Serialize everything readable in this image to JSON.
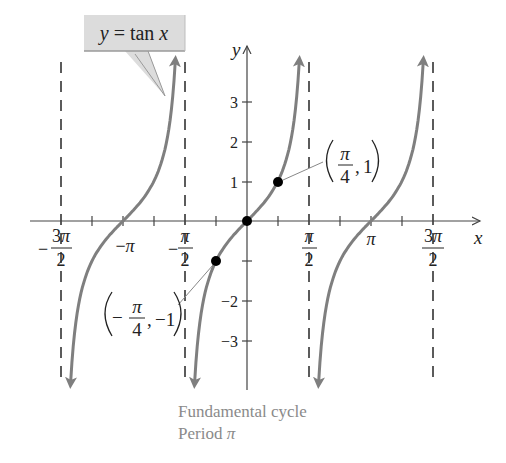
{
  "chart_data": {
    "type": "line",
    "title": "y = tan x",
    "xlabel": "x",
    "ylabel": "y",
    "function": "tan x",
    "x_ticks": [
      "-3π/2",
      "-π",
      "-π/2",
      "π/2",
      "π",
      "3π/2"
    ],
    "x_tick_values": [
      -4.712,
      -3.1416,
      -1.5708,
      1.5708,
      3.1416,
      4.712
    ],
    "minor_x_tick_values": [
      -3.927,
      -2.356,
      -0.785,
      0.785,
      2.356,
      3.927
    ],
    "y_ticks": [
      -3,
      -2,
      -1,
      1,
      2,
      3
    ],
    "xlim": [
      -5.3,
      5.8
    ],
    "ylim": [
      -4.1,
      4.4
    ],
    "asymptotes": [
      "-3π/2",
      "-π/2",
      "π/2",
      "3π/2"
    ],
    "asymptote_values": [
      -4.712,
      -1.5708,
      1.5708,
      4.712
    ],
    "series": [
      {
        "name": "branch (-3π/2, -π/2)",
        "x_range": [
          -4.712,
          -1.5708
        ],
        "center": -3.1416
      },
      {
        "name": "branch (-π/2, π/2) fundamental cycle",
        "x_range": [
          -1.5708,
          1.5708
        ],
        "center": 0
      },
      {
        "name": "branch (π/2, 3π/2)",
        "x_range": [
          1.5708,
          4.712
        ],
        "center": 3.1416
      }
    ],
    "highlighted_points": [
      {
        "x": -0.785,
        "y": -1,
        "label": "(-π/4, -1)"
      },
      {
        "x": 0,
        "y": 0,
        "label": ""
      },
      {
        "x": 0.785,
        "y": 1,
        "label": "(π/4, 1)"
      }
    ],
    "annotations": [
      "y = tan x",
      "(π/4, 1)",
      "(-π/4, -1)",
      "Fundamental cycle",
      "Period π"
    ],
    "grid": false,
    "colors": {
      "curve": "#7f7f7f",
      "axes": "#444444",
      "asymptote": "#333333",
      "callout_fill": "#dcdcdc",
      "callout_border": "#9a9a9a",
      "caption": "#8a8a8a"
    }
  },
  "labels": {
    "callout_y": "y",
    "callout_eq": " = tan ",
    "callout_x": "x",
    "axis_x": "x",
    "axis_y": "y",
    "pi": "π",
    "minus": "−",
    "three": "3",
    "two": "2",
    "four": "4",
    "one": "1",
    "neg_one": "−1",
    "comma": ",",
    "y1": "1",
    "y2": "2",
    "y3": "3",
    "yn2": "−2",
    "yn3": "−3",
    "caption_line1": "Fundamental cycle",
    "caption_line2_text": "Period ",
    "caption_line2_pi": "π"
  }
}
